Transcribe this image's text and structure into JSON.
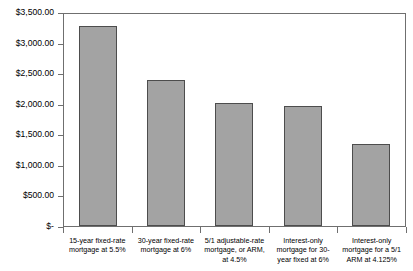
{
  "chart_data": {
    "type": "bar",
    "title": "",
    "xlabel": "",
    "ylabel": "",
    "grid": false,
    "legend": "none",
    "ylim": [
      0,
      3500
    ],
    "ytick_values": [
      3500,
      3000,
      2500,
      2000,
      1500,
      1000,
      500,
      0
    ],
    "ytick_labels": [
      "$3,500.00",
      "$3,000.00",
      "$2,500.00",
      "$2,000.00",
      "$1,500.00",
      "$1,000.00",
      "$500.00",
      "$-"
    ],
    "categories": [
      "15-year fixed-rate mortgage at 5.5%",
      "30-year fixed-rate mortgage at 6%",
      "5/1 adjustable-rate mortgage, or ARM, at 4.5%",
      "Interest-only mortgage for 30-year fixed at 6%",
      "Interest-only mortgage for a 5/1 ARM at 4.125%"
    ],
    "values": [
      3270,
      2390,
      2010,
      1970,
      1340
    ],
    "bar_color": "#a3a3a3",
    "bar_border_color": "#4d4d4d",
    "axis_color": "#6f6f6f"
  },
  "x_axis": {
    "labels": [
      {
        "line1": "15-year fixed-rate",
        "line2": "mortgage at 5.5%",
        "line3": ""
      },
      {
        "line1": "30-year fixed-rate",
        "line2": "mortgage at 6%",
        "line3": ""
      },
      {
        "line1": "5/1 adjustable-rate",
        "line2": "mortgage, or ARM,",
        "line3": "at 4.5%"
      },
      {
        "line1": "Interest-only",
        "line2": "mortgage for 30-",
        "line3": "year fixed at 6%"
      },
      {
        "line1": "Interest-only",
        "line2": "mortgage for a 5/1",
        "line3": "ARM at 4.125%"
      }
    ]
  }
}
